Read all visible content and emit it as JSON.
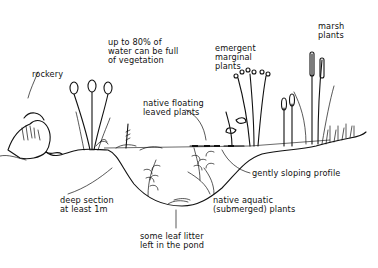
{
  "diagram": {
    "colors": {
      "ink": "#111111",
      "background": "#ffffff"
    },
    "labels": {
      "vegetation": "up to 80% of\nwater can be full\nof vegetation",
      "rockery": "rockery",
      "emergent": "emergent\nmarginal\nplants",
      "marsh": "marsh\nplants",
      "floating": "native floating\nleaved plants",
      "sloping": "gently sloping profile",
      "deep": "deep section\nat least 1m",
      "aquatic": "native aquatic\n(submerged) plants",
      "leaf_litter": "some leaf litter\nleft in the pond"
    }
  }
}
